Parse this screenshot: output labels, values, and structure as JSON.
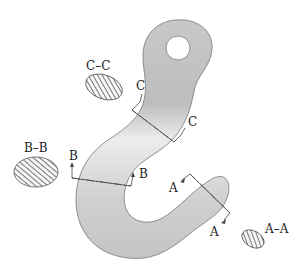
{
  "diagram": {
    "colors": {
      "hook_fill_light": "#e6e6e6",
      "hook_fill_dark": "#b8b8b8",
      "outline": "#666666",
      "hatch": "#333333",
      "section_fill": "#f4f4f4"
    },
    "cut_planes": [
      {
        "id": "C",
        "start_label": "C",
        "end_label": "C"
      },
      {
        "id": "B",
        "start_label": "B",
        "end_label": "B"
      },
      {
        "id": "A",
        "start_label": "A",
        "end_label": "A"
      }
    ],
    "sections": [
      {
        "id": "section-c",
        "label": "C–C"
      },
      {
        "id": "section-b",
        "label": "B–B"
      },
      {
        "id": "section-a",
        "label": "A–A"
      }
    ]
  }
}
